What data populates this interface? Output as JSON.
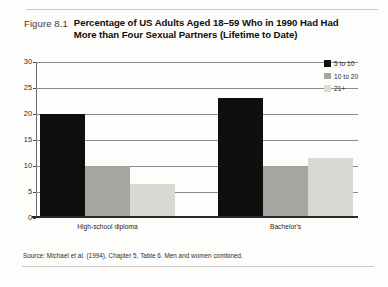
{
  "figure": {
    "number": "Figure 8.1",
    "title": "Percentage of US Adults Aged 18–59 Who in 1990 Had Had More than Four Sexual Partners (Lifetime to Date)",
    "source_note": "Source: Michael et al. (1994), Chapter 5, Table 6. Men and women combined."
  },
  "colors": {
    "series_5_to_10": "#100f0e",
    "series_10_to_20": "#a7a5a2",
    "series_21_plus": "#d9d8d5",
    "gridline": "#8d8b88",
    "axis": "#2b2a28"
  },
  "chart_data": {
    "type": "bar",
    "title": "Percentage of US Adults Aged 18–59 Who in 1990 Had Had More than Four Sexual Partners (Lifetime to Date)",
    "xlabel": "",
    "ylabel": "",
    "categories": [
      "High-school diploma",
      "Bachelor's"
    ],
    "series": [
      {
        "name": "5 to 10",
        "values": [
          20,
          23
        ]
      },
      {
        "name": "10 to 20",
        "values": [
          10,
          10
        ]
      },
      {
        "name": "21+",
        "values": [
          6.5,
          11.5
        ]
      }
    ],
    "ylim": [
      0,
      30
    ],
    "yticks": [
      0,
      5,
      10,
      15,
      20,
      25,
      30
    ],
    "ytick_labels": [
      "0",
      "5",
      "10",
      "15",
      "20",
      "25",
      "30"
    ],
    "grid": true,
    "legend_position": "top-right",
    "legend_entries": [
      "5 to 10",
      "10 to 20",
      "21+"
    ]
  }
}
